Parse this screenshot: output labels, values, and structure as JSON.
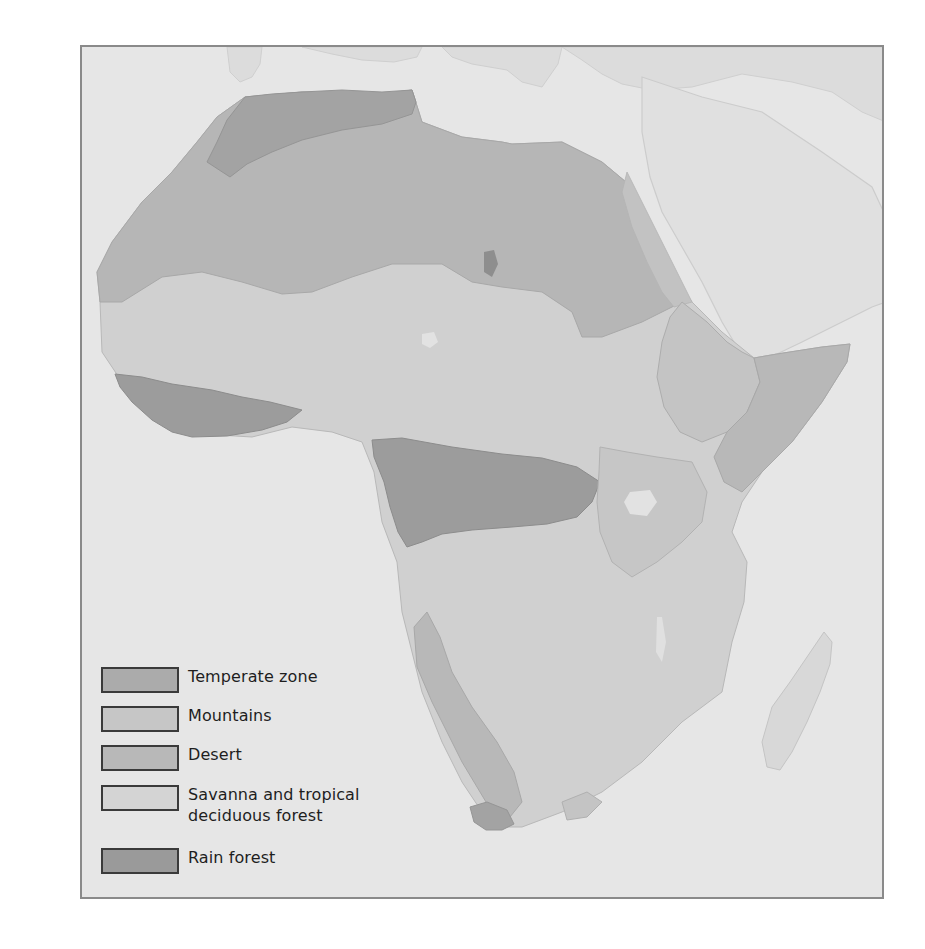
{
  "map": {
    "subject": "Africa vegetation / climate zones",
    "background_color": "#e6e6e6",
    "frame_color": "#8a8a8a",
    "regions": {
      "temperate_zone": {
        "color": "#ababab"
      },
      "mountains": {
        "color": "#c2c2c2"
      },
      "desert": {
        "color": "#b6b6b6"
      },
      "savanna": {
        "color": "#d0d0d0"
      },
      "rain_forest": {
        "color": "#9c9c9c"
      },
      "surrounding_land": {
        "color": "#dcdcdc"
      }
    }
  },
  "legend": {
    "items": [
      {
        "label": "Temperate zone",
        "color": "#ababab"
      },
      {
        "label": "Mountains",
        "color": "#c6c6c6"
      },
      {
        "label": "Desert",
        "color": "#b8b8b8"
      },
      {
        "label": "Savanna and tropical",
        "label_line2": "deciduous forest",
        "color": "#d4d4d4"
      },
      {
        "label": "Rain forest",
        "color": "#9a9a9a"
      }
    ]
  }
}
